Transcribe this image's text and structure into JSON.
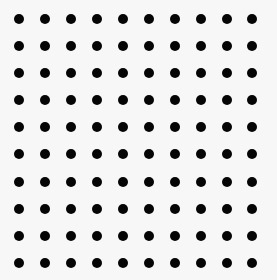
{
  "figure": {
    "type": "dot-grid",
    "rows": 10,
    "columns": 10,
    "dot_color": "#050505",
    "background_color": "#f7f7f7",
    "dot_diameter_px": 10,
    "column_centers_px": [
      19,
      45,
      71,
      97,
      123,
      149,
      175,
      201,
      227,
      252
    ],
    "row_centers_px": [
      19,
      46,
      73,
      100,
      127,
      154,
      182,
      209,
      236,
      263
    ]
  }
}
